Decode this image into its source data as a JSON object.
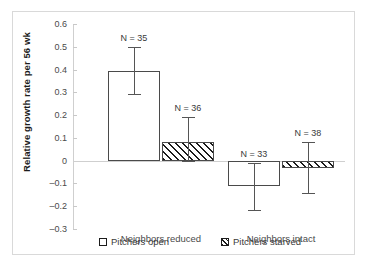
{
  "chart_data": {
    "type": "bar",
    "title": "",
    "xlabel": "",
    "ylabel": "Relative growth rate per 56 wk",
    "ylim": [
      -0.3,
      0.6
    ],
    "ytick_values": [
      0.6,
      0.5,
      0.4,
      0.3,
      0.2,
      0.1,
      0,
      -0.1,
      -0.2,
      -0.3
    ],
    "ytick_labels": [
      "0.6",
      "0.5",
      "0.4",
      "0.3",
      "0.2",
      "0.1",
      "0",
      "–0.1",
      "–0.2",
      "–0.3"
    ],
    "grid": false,
    "legend_position": "bottom",
    "categories": [
      "Neighbors reduced",
      "Neighbors intact"
    ],
    "series": [
      {
        "name": "Pitchers open",
        "pattern": "open",
        "values": [
          0.395,
          -0.112
        ],
        "error_low": [
          0.292,
          -0.215
        ],
        "error_high": [
          0.5,
          -0.01
        ],
        "n_labels": [
          "N = 35",
          "N = 33"
        ]
      },
      {
        "name": "Pitchers starved",
        "pattern": "hatched",
        "values": [
          0.083,
          -0.032
        ],
        "error_low": [
          -0.002,
          -0.143
        ],
        "error_high": [
          0.19,
          0.08
        ],
        "n_labels": [
          "N = 36",
          "N = 38"
        ]
      }
    ],
    "annotations": [
      "N = 35",
      "N = 36",
      "N = 33",
      "N = 38"
    ],
    "colors": {
      "bar_outline": "#4a4a4a",
      "hatch": "#1c1c1c",
      "axis": "#cfcfcf",
      "text": "#3a3a3a",
      "frame": "#d9d9d9"
    }
  }
}
